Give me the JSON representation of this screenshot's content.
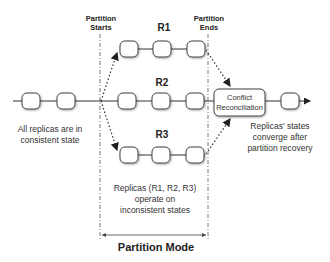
{
  "diagram": {
    "markers": {
      "partition_starts": "Partition\nStarts",
      "partition_starts_l1": "Partition",
      "partition_starts_l2": "Starts",
      "partition_ends_l1": "Partition",
      "partition_ends_l2": "Ends"
    },
    "replicas": [
      {
        "label": "R1",
        "nodes": 3
      },
      {
        "label": "R2",
        "nodes": 3
      },
      {
        "label": "R3",
        "nodes": 3
      }
    ],
    "reconciliation": {
      "line1": "Conflict",
      "line2": "Reconciliation"
    },
    "notes": {
      "consistent_l1": "All replicas are in",
      "consistent_l2": "consistent state",
      "inconsistent_l1": "Replicas (R1, R2, R3)",
      "inconsistent_l2": "operate on",
      "inconsistent_l3": "inconsistent states",
      "converge_l1": "Replicas' states",
      "converge_l2": "converge after",
      "converge_l3": "partition recovery"
    },
    "mode_label": "Partition Mode",
    "colors": {
      "line": "#333333",
      "node_border": "#444444",
      "node_fill": "#ffffff",
      "dashed": "#555555"
    }
  }
}
